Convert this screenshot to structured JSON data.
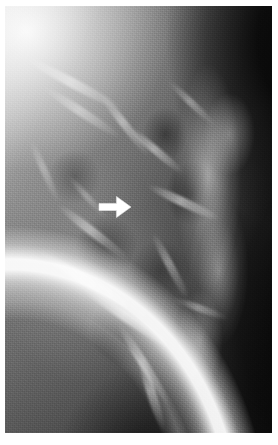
{
  "image": {
    "kind": "radiograph",
    "modality_label": "X-ray radiograph",
    "view_label": "Lateral projection",
    "rendering": "grayscale",
    "plate": {
      "left_px": 5,
      "top_px": 6,
      "width_px": 267,
      "height_px": 427,
      "border_color": "#ffffff",
      "background_color": "#ffffff"
    },
    "tones": {
      "highlight": "#ffffff",
      "bright_tissue": "#dcdcdc",
      "mid_tissue": "#8f8f8f",
      "soft_shadow": "#4d4d4d",
      "deep_shadow": "#1b1b1b",
      "background_black": "#000000"
    },
    "regions": [
      {
        "name": "upper-left-bright-tissue",
        "tone": "#dcdcdc"
      },
      {
        "name": "curved-skin-border",
        "tone": "#ffffff"
      },
      {
        "name": "upper-right-dark-background",
        "tone": "#0d0d0d"
      },
      {
        "name": "central-parenchyma",
        "tone": "#6e6e6e"
      },
      {
        "name": "right-bright-column",
        "tone": "#cfcfcf"
      },
      {
        "name": "lower-right-dark-background",
        "tone": "#1b1b1b"
      }
    ],
    "streaks": [
      {
        "name": "rib-streak-1",
        "left_pct": 6,
        "top_pct": 17,
        "width_pct": 40,
        "height_pct": 2.4,
        "rotate_deg": 28,
        "opacity": 0.55
      },
      {
        "name": "rib-streak-2",
        "left_pct": 12,
        "top_pct": 24,
        "width_pct": 34,
        "height_pct": 2.0,
        "rotate_deg": 33,
        "opacity": 0.45
      },
      {
        "name": "rib-streak-3",
        "left_pct": 30,
        "top_pct": 27,
        "width_pct": 30,
        "height_pct": 1.8,
        "rotate_deg": 52,
        "opacity": 0.5
      },
      {
        "name": "rib-streak-4",
        "left_pct": 44,
        "top_pct": 33,
        "width_pct": 26,
        "height_pct": 1.8,
        "rotate_deg": 40,
        "opacity": 0.55
      },
      {
        "name": "rib-streak-5",
        "left_pct": 52,
        "top_pct": 45,
        "width_pct": 30,
        "height_pct": 2.0,
        "rotate_deg": 25,
        "opacity": 0.6
      },
      {
        "name": "rib-streak-6",
        "left_pct": 16,
        "top_pct": 52,
        "width_pct": 34,
        "height_pct": 2.2,
        "rotate_deg": 38,
        "opacity": 0.55
      },
      {
        "name": "rib-streak-7",
        "left_pct": 10,
        "top_pct": 63,
        "width_pct": 40,
        "height_pct": 2.4,
        "rotate_deg": 31,
        "opacity": 0.6
      },
      {
        "name": "rib-streak-8",
        "left_pct": 26,
        "top_pct": 72,
        "width_pct": 40,
        "height_pct": 2.4,
        "rotate_deg": 34,
        "opacity": 0.58
      },
      {
        "name": "rib-streak-9",
        "left_pct": 34,
        "top_pct": 83,
        "width_pct": 36,
        "height_pct": 2.2,
        "rotate_deg": 58,
        "opacity": 0.55
      },
      {
        "name": "rib-streak-10",
        "left_pct": 48,
        "top_pct": 60,
        "width_pct": 28,
        "height_pct": 1.8,
        "rotate_deg": 62,
        "opacity": 0.45
      },
      {
        "name": "rib-streak-11",
        "left_pct": 2,
        "top_pct": 38,
        "width_pct": 26,
        "height_pct": 1.6,
        "rotate_deg": 66,
        "opacity": 0.35
      },
      {
        "name": "rib-streak-12",
        "left_pct": 58,
        "top_pct": 22,
        "width_pct": 24,
        "height_pct": 1.6,
        "rotate_deg": 44,
        "opacity": 0.42
      },
      {
        "name": "rib-streak-13",
        "left_pct": 40,
        "top_pct": 90,
        "width_pct": 30,
        "height_pct": 2.0,
        "rotate_deg": 72,
        "opacity": 0.5
      },
      {
        "name": "rib-streak-14",
        "left_pct": 20,
        "top_pct": 44,
        "width_pct": 22,
        "height_pct": 1.4,
        "rotate_deg": 48,
        "opacity": 0.32
      },
      {
        "name": "rib-streak-15",
        "left_pct": 62,
        "top_pct": 70,
        "width_pct": 22,
        "height_pct": 1.6,
        "rotate_deg": 20,
        "opacity": 0.4
      }
    ]
  },
  "annotation": {
    "marker_name": "pointer-arrow",
    "shape": "solid-block-arrow",
    "direction": "right",
    "color": "#ffffff",
    "outline_color": "#e8e8e8",
    "position": {
      "x_px": 96,
      "y_px": 192,
      "width_px": 38,
      "height_px": 30
    },
    "points_to": "lesion-site",
    "caption": ""
  }
}
